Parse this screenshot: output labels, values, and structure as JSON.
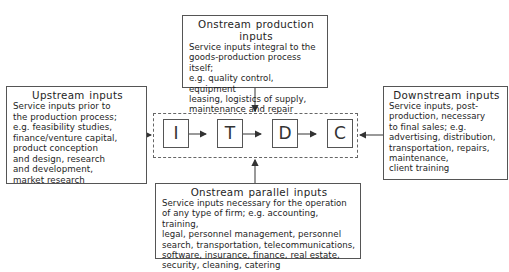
{
  "diagram": {
    "top": {
      "title": "Onstream production inputs",
      "lines": [
        "Service inputs integral to the",
        "goods-production process itself;",
        "e.g. quality control, equipment",
        "leasing, logistics of supply,",
        "maintenance and repair"
      ]
    },
    "left": {
      "title": "Upstream inputs",
      "lines": [
        "Service inputs prior to",
        "the production process;",
        "e.g. feasibility studies,",
        "finance/venture capital,",
        "product conception",
        "and design, research",
        "and development,",
        "market research"
      ]
    },
    "right": {
      "title": "Downstream inputs",
      "lines": [
        "Service inputs, post-",
        "production, necessary",
        "to final sales; e.g.",
        "advertising, distribution,",
        "transportation, repairs,",
        "maintenance,",
        "client training"
      ]
    },
    "bottom": {
      "title": "Onstream parallel inputs",
      "lines": [
        "Service inputs necessary for the operation",
        "of any type of firm; e.g. accounting, training,",
        "legal, personnel management, personnel",
        "search, transportation, telecommunications,",
        "software, insurance, finance, real estate,",
        "security, cleaning, catering"
      ]
    },
    "chain": {
      "nodes": [
        "I",
        "T",
        "D",
        "C"
      ]
    }
  }
}
